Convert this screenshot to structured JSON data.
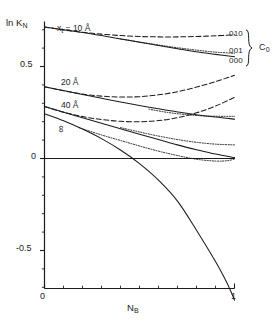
{
  "figure": {
    "background": "#ffffff",
    "ink_color": "#1c1c1c"
  },
  "axes": {
    "y_axis_title": "ln K",
    "y_axis_title_sub": "N",
    "x_axis_title": "N",
    "x_axis_title_sub": "B",
    "y_ticks": [
      {
        "value": 0.5,
        "label": "0.5"
      },
      {
        "value": 0.0,
        "label": "0"
      },
      {
        "value": -0.5,
        "label": "-0.5"
      }
    ],
    "x_ticks": [
      {
        "value": 0,
        "label": "0"
      },
      {
        "value": 1,
        "label": "1"
      }
    ],
    "xlim": [
      0,
      1
    ],
    "ylim": [
      -0.78,
      0.8
    ]
  },
  "curve_labels": [
    {
      "text": "x",
      "sub": "t",
      "rest": " = 10 Å",
      "name": "xt-10-angstrom"
    },
    {
      "text": "20 Å",
      "name": "20-angstrom"
    },
    {
      "text": "40 Å",
      "name": "40-angstrom"
    },
    {
      "text": "∞",
      "name": "infinity"
    }
  ],
  "series_labels": {
    "items": [
      "010",
      "001",
      "000"
    ],
    "group": "C",
    "group_sub": "0"
  },
  "chart_data": {
    "type": "line",
    "title": "",
    "xlabel": "N_B",
    "ylabel": "ln K_N",
    "xlim": [
      0,
      1
    ],
    "ylim": [
      -0.78,
      0.8
    ],
    "grid": false,
    "legend_position": "right",
    "annotations": [
      {
        "text": "x_t = 10 Å",
        "x": 0.12,
        "y": 0.75
      },
      {
        "text": "20 Å",
        "x": 0.14,
        "y": 0.43
      },
      {
        "text": "40 Å",
        "x": 0.14,
        "y": 0.3
      },
      {
        "text": "∞",
        "x": 0.15,
        "y": 0.19
      },
      {
        "text": "010",
        "x": 1.02,
        "y": 0.665
      },
      {
        "text": "001",
        "x": 1.02,
        "y": 0.575
      },
      {
        "text": "000",
        "x": 1.02,
        "y": 0.525
      },
      {
        "text": "C_0",
        "x": 1.14,
        "y": 0.6
      }
    ],
    "series": [
      {
        "name": "xt=10 Å, 000 (solid)",
        "style": "solid",
        "x": [
          0.0,
          0.1,
          0.2,
          0.3,
          0.4,
          0.5,
          0.6,
          0.7,
          0.8,
          0.9,
          1.0
        ],
        "y": [
          0.715,
          0.7,
          0.685,
          0.668,
          0.65,
          0.632,
          0.614,
          0.597,
          0.58,
          0.566,
          0.553
        ]
      },
      {
        "name": "xt=10 Å, 010 (dashed)",
        "style": "dashed",
        "x": [
          0.0,
          0.1,
          0.2,
          0.3,
          0.4,
          0.5,
          0.6,
          0.7,
          0.8,
          0.9,
          1.0
        ],
        "y": [
          0.715,
          0.699,
          0.686,
          0.676,
          0.668,
          0.663,
          0.661,
          0.661,
          0.663,
          0.667,
          0.672
        ]
      },
      {
        "name": "xt=10 Å, 001 (dotted)",
        "style": "dotted",
        "x": [
          0.4,
          0.5,
          0.6,
          0.7,
          0.8,
          0.9,
          1.0
        ],
        "y": [
          0.65,
          0.633,
          0.617,
          0.602,
          0.589,
          0.578,
          0.572
        ]
      },
      {
        "name": "xt=20 Å, 000 (solid)",
        "style": "solid",
        "x": [
          0.0,
          0.1,
          0.2,
          0.3,
          0.4,
          0.5,
          0.6,
          0.7,
          0.8,
          0.9,
          1.0
        ],
        "y": [
          0.39,
          0.369,
          0.348,
          0.327,
          0.307,
          0.288,
          0.27,
          0.253,
          0.238,
          0.225,
          0.214
        ]
      },
      {
        "name": "xt=20 Å, 010 (dashed)",
        "style": "dashed",
        "x": [
          0.0,
          0.1,
          0.2,
          0.3,
          0.4,
          0.5,
          0.6,
          0.7,
          0.8,
          0.9,
          1.0
        ],
        "y": [
          0.39,
          0.368,
          0.35,
          0.339,
          0.334,
          0.336,
          0.346,
          0.363,
          0.388,
          0.418,
          0.452
        ]
      },
      {
        "name": "xt=20 Å, 001 (dotted)",
        "style": "dotted",
        "x": [
          0.55,
          0.65,
          0.75,
          0.85,
          0.95,
          1.0
        ],
        "y": [
          0.268,
          0.25,
          0.238,
          0.231,
          0.229,
          0.229
        ]
      },
      {
        "name": "xt=40 Å, 000 (solid)",
        "style": "solid",
        "x": [
          0.0,
          0.1,
          0.2,
          0.3,
          0.4,
          0.5,
          0.6,
          0.7,
          0.8,
          0.9,
          1.0
        ],
        "y": [
          0.282,
          0.252,
          0.222,
          0.192,
          0.162,
          0.132,
          0.103,
          0.074,
          0.048,
          0.024,
          0.005
        ]
      },
      {
        "name": "xt=40 Å, 010 (dashed)",
        "style": "dashed",
        "x": [
          0.0,
          0.1,
          0.2,
          0.3,
          0.4,
          0.5,
          0.6,
          0.7,
          0.8,
          0.9,
          1.0
        ],
        "y": [
          0.282,
          0.252,
          0.228,
          0.212,
          0.202,
          0.2,
          0.206,
          0.222,
          0.248,
          0.285,
          0.332
        ]
      },
      {
        "name": "xt=40 Å, 001 (dotted)",
        "style": "dotted",
        "x": [
          0.4,
          0.5,
          0.6,
          0.7,
          0.8,
          0.9,
          1.0
        ],
        "y": [
          0.168,
          0.144,
          0.122,
          0.103,
          0.088,
          0.078,
          0.074
        ]
      },
      {
        "name": "infinity, 000 (solid)",
        "style": "solid",
        "x": [
          0.0,
          0.1,
          0.2,
          0.3,
          0.4,
          0.5,
          0.6,
          0.7,
          0.8,
          0.9,
          0.95,
          0.98,
          1.0
        ],
        "y": [
          0.243,
          0.205,
          0.16,
          0.108,
          0.046,
          -0.028,
          -0.118,
          -0.232,
          -0.39,
          -0.56,
          -0.655,
          -0.72,
          -0.77
        ]
      },
      {
        "name": "infinity, 001 (dotted)",
        "style": "dotted",
        "x": [
          0.18,
          0.3,
          0.4,
          0.5,
          0.6,
          0.7,
          0.8,
          0.9,
          0.96,
          1.0
        ],
        "y": [
          0.168,
          0.128,
          0.098,
          0.068,
          0.04,
          0.016,
          -0.004,
          -0.014,
          -0.012,
          -0.004
        ]
      },
      {
        "name": "zero-reference baseline (solid)",
        "style": "solid",
        "x": [
          0.0,
          1.0
        ],
        "y": [
          0.0,
          0.0
        ]
      }
    ]
  }
}
